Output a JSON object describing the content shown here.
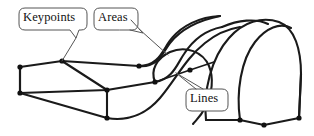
{
  "figure": {
    "kind": "engineering-geometry-diagram",
    "width": 314,
    "height": 136,
    "background_color": "#ffffff",
    "line_color": "#1a1a1a",
    "callout_stroke_color": "#555555",
    "keypoint_color": "#111111"
  },
  "callouts": [
    {
      "id": "keypoints",
      "label": "Keypoints",
      "box": {
        "x": 19,
        "y": 8,
        "width": 68,
        "height": 22
      },
      "tail_from": {
        "x": 73,
        "y": 30
      },
      "tail_to": {
        "x": 62,
        "y": 61
      },
      "points_to": "slab-back-top-left-corner"
    },
    {
      "id": "areas",
      "label": "Areas",
      "box": {
        "x": 94,
        "y": 8,
        "width": 44,
        "height": 22
      },
      "tail_from": {
        "x": 132,
        "y": 29
      },
      "tail_to": {
        "x": 160,
        "y": 52
      },
      "points_to": "curved-surface-of-vault"
    },
    {
      "id": "lines",
      "label": "Lines",
      "box": {
        "x": 186,
        "y": 89,
        "width": 42,
        "height": 22
      },
      "tail_from": {
        "x": 192,
        "y": 89
      },
      "tail_to": {
        "x": 172,
        "y": 73
      },
      "points_to": "edge-line-on-s-curve"
    }
  ],
  "geometry": {
    "slab": {
      "name": "rectangular-slab",
      "vertices": {
        "back_top_left": {
          "x": 20,
          "y": 67
        },
        "back_top_right": {
          "x": 62,
          "y": 61
        },
        "front_top_right": {
          "x": 107,
          "y": 90
        },
        "front_top_left": {
          "x": 20,
          "y": 93
        },
        "back_bottom_left": {
          "x": 20,
          "y": 93
        },
        "front_bottom": {
          "x": 107,
          "y": 118
        }
      }
    },
    "arch": {
      "name": "barrel-arch-vault",
      "base_keypoints": [
        {
          "x": 240,
          "y": 120
        },
        {
          "x": 264,
          "y": 125
        },
        {
          "x": 299,
          "y": 118
        }
      ],
      "crown_y": 16
    },
    "keypoint_dots": [
      {
        "x": 20,
        "y": 67
      },
      {
        "x": 62,
        "y": 61
      },
      {
        "x": 20,
        "y": 93
      },
      {
        "x": 107,
        "y": 90
      },
      {
        "x": 107,
        "y": 118
      },
      {
        "x": 139,
        "y": 66
      },
      {
        "x": 155,
        "y": 82
      },
      {
        "x": 190,
        "y": 70
      },
      {
        "x": 240,
        "y": 120
      },
      {
        "x": 264,
        "y": 125
      },
      {
        "x": 299,
        "y": 118
      }
    ]
  }
}
